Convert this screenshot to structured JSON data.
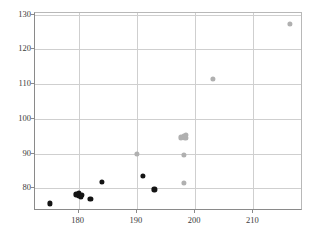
{
  "chart_data": {
    "type": "scatter",
    "title": "",
    "xlabel": "",
    "ylabel": "",
    "xlim": [
      172.5,
      218.5
    ],
    "ylim": [
      73.5,
      130.5
    ],
    "xticks": [
      180,
      190,
      200,
      210
    ],
    "yticks": [
      80,
      90,
      100,
      110,
      120,
      130
    ],
    "grid": true,
    "legend": "none",
    "series": [
      {
        "name": "black-series",
        "color": "#141414",
        "marker": "circle",
        "points": [
          {
            "x": 175.0,
            "y": 75.7
          },
          {
            "x": 179.6,
            "y": 78.3
          },
          {
            "x": 180.0,
            "y": 77.8
          },
          {
            "x": 180.1,
            "y": 78.6
          },
          {
            "x": 180.4,
            "y": 77.6
          },
          {
            "x": 180.6,
            "y": 78.2
          },
          {
            "x": 182.0,
            "y": 77.0
          },
          {
            "x": 184.0,
            "y": 81.8
          },
          {
            "x": 191.0,
            "y": 83.7
          },
          {
            "x": 193.0,
            "y": 79.7
          }
        ]
      },
      {
        "name": "gray-series",
        "color": "#b0b0b0",
        "marker": "circle",
        "points": [
          {
            "x": 190.0,
            "y": 90.0
          },
          {
            "x": 198.0,
            "y": 89.7
          },
          {
            "x": 198.0,
            "y": 81.7
          },
          {
            "x": 197.6,
            "y": 94.7
          },
          {
            "x": 198.0,
            "y": 95.2
          },
          {
            "x": 198.3,
            "y": 94.5
          },
          {
            "x": 198.4,
            "y": 95.4
          },
          {
            "x": 203.0,
            "y": 111.5
          },
          {
            "x": 216.2,
            "y": 127.3
          }
        ]
      }
    ]
  }
}
